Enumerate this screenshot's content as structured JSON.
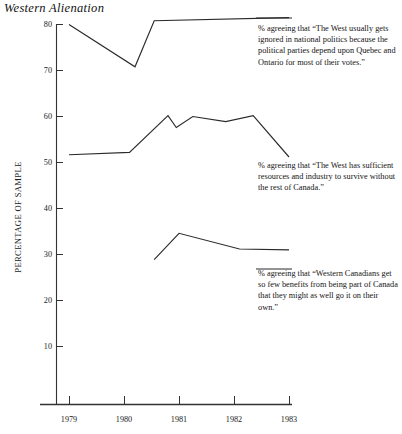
{
  "figure": {
    "title": "Western Alienation",
    "ylabel": "PERCENTAGE OF SAMPLE"
  },
  "chart_data": {
    "type": "line",
    "title": "Western Alienation",
    "xlabel": "",
    "ylabel": "PERCENTAGE OF SAMPLE",
    "xlim": [
      1978.6,
      1983.4
    ],
    "ylim": [
      10,
      80
    ],
    "yticks": [
      10,
      20,
      30,
      40,
      50,
      60,
      70,
      80
    ],
    "xticks": [
      1979,
      1980,
      1981,
      1982,
      1983
    ],
    "grid": false,
    "legend": "annotations at right of each line",
    "series": [
      {
        "name": "ignored-in-national-politics",
        "annotation": "% agreeing that “The West usually gets ignored in  national politics because the political parties depend upon Quebec and Ontario for most of their votes.”",
        "x": [
          1979.0,
          1980.2,
          1980.55,
          1983.0
        ],
        "values": [
          80.0,
          70.8,
          80.8,
          81.5
        ]
      },
      {
        "name": "sufficient-resources-to-survive-without-canada",
        "annotation": "% agreeing that “The West has sufficient resources and industry to survive without the rest of Canada.”",
        "x": [
          1979.0,
          1980.1,
          1980.8,
          1980.95,
          1981.25,
          1981.85,
          1982.35,
          1983.0
        ],
        "values": [
          51.7,
          52.2,
          60.2,
          57.6,
          60.0,
          58.9,
          60.2,
          51.2
        ]
      },
      {
        "name": "go-it-on-their-own",
        "annotation": "% agreeing that “Western Canadians get so few benefits from being part of Canada that they might as well go it on their own.”",
        "x": [
          1980.55,
          1981.0,
          1982.1,
          1983.0
        ],
        "values": [
          28.9,
          34.6,
          31.2,
          31.0
        ]
      }
    ]
  },
  "ytick_labels": [
    "80",
    "70",
    "60",
    "50",
    "40",
    "30",
    "20",
    "10"
  ],
  "xtick_labels": [
    "1979",
    "1980",
    "1981",
    "1982",
    "1983"
  ],
  "annotations": {
    "top": "% agreeing that “The West usually gets ignored in  national politics because the political parties depend upon Quebec and Ontario for most of their votes.”",
    "middle": "% agreeing that “The West has sufficient resources and industry to survive without the rest of Canada.”",
    "bottom": "% agreeing that “Western Canadians get so few benefits from being part of Canada that they might as well go it on their own.”"
  }
}
